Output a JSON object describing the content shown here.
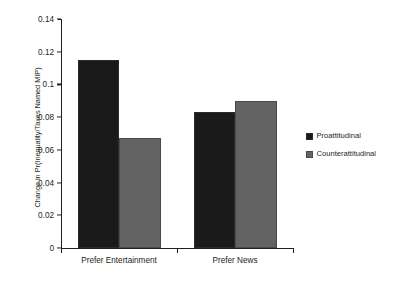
{
  "chart_data": {
    "type": "bar",
    "title": "",
    "xlabel": "",
    "ylabel": "Change in Pr(Inequality/Taxes Named MIP)",
    "categories": [
      "Prefer Entertainment",
      "Prefer News"
    ],
    "series": [
      {
        "name": "Proattitudinal",
        "color": "#1a1a1a",
        "values": [
          0.115,
          0.083
        ]
      },
      {
        "name": "Counterattitudinal",
        "color": "#636363",
        "values": [
          0.067,
          0.09
        ]
      }
    ],
    "ylim": [
      0,
      0.14
    ],
    "yticks": [
      0,
      0.02,
      0.04,
      0.06,
      0.08,
      0.1,
      0.12,
      0.14
    ],
    "ytick_labels": [
      "0",
      "0.02",
      "0.04",
      "0.06",
      "0.08",
      "0.1",
      "0.12",
      "0.14"
    ],
    "grid": false,
    "legend_position": "right"
  },
  "legend": {
    "items": [
      {
        "label": "Proattitudinal",
        "color": "#1a1a1a",
        "icon": "square-swatch-icon"
      },
      {
        "label": "Counterattitudinal",
        "color": "#636363",
        "icon": "square-swatch-icon"
      }
    ]
  },
  "colors": {
    "axis": "#231f20",
    "text": "#231f20",
    "background": "#ffffff",
    "proattitudinal": "#1a1a1a",
    "counterattitudinal": "#636363"
  }
}
